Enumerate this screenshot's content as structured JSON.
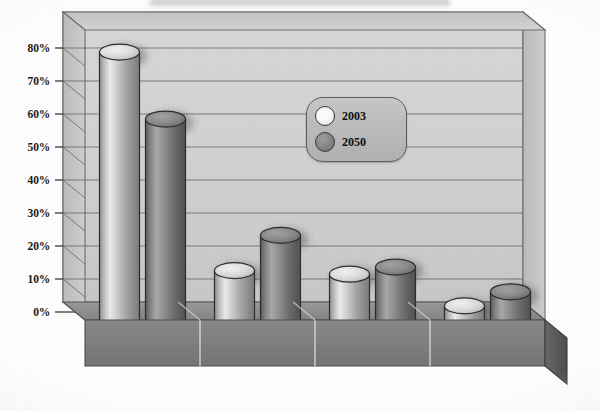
{
  "chart_data": {
    "type": "bar",
    "title": "",
    "subtitle": "",
    "xlabel": "",
    "ylabel": "",
    "categories": [
      "White",
      "Hispanic",
      "Black",
      "Asian &\nPacific Islander"
    ],
    "category_labels": [
      {
        "line1": "White",
        "line2": ""
      },
      {
        "line1": "Hispanic",
        "line2": ""
      },
      {
        "line1": "Black",
        "line2": ""
      },
      {
        "line1": "Asian &",
        "line2": "Pacific Islander"
      }
    ],
    "series": [
      {
        "name": "2003",
        "values": [
          76,
          14,
          13,
          4
        ],
        "color": "#d8d8d8"
      },
      {
        "name": "2050",
        "values": [
          57,
          24,
          15,
          8
        ],
        "color": "#8c8c8c"
      }
    ],
    "ylim": [
      0,
      80
    ],
    "yticks": [
      0,
      10,
      20,
      30,
      40,
      50,
      60,
      70,
      80
    ],
    "ytick_labels": [
      "0%",
      "10%",
      "20%",
      "30%",
      "40%",
      "50%",
      "60%",
      "70%",
      "80%"
    ],
    "grid": true,
    "grid_axis": "y",
    "legend_position": "center-right",
    "style": "3d-cylinder-columns",
    "value_unit": "percent"
  },
  "legend": {
    "entries": [
      {
        "label": "2003",
        "swatch": "light-circle"
      },
      {
        "label": "2050",
        "swatch": "dark-circle"
      }
    ]
  },
  "colors": {
    "wall_back": "#d4d4d4",
    "wall_side": "#c2c2c2",
    "floor_top": "#8f8f8f",
    "floor_front": "#7a7a7a",
    "floor_side": "#5a5a5a",
    "gridline": "#6b6b6b",
    "bar_2003_light": "#ececec",
    "bar_2003_dark": "#9a9a9a",
    "bar_2050_light": "#a8a8a8",
    "bar_2050_dark": "#5f5f5f",
    "outline": "#2e2e2e",
    "axis_text": "#1b1b1b",
    "category_text": "#ffffff"
  }
}
